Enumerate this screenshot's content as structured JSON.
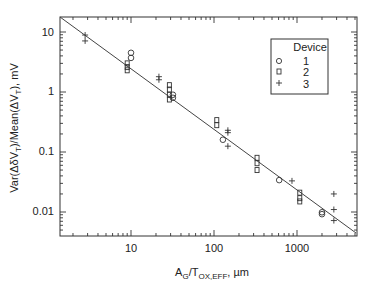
{
  "chart_data": {
    "type": "scatter",
    "title": "",
    "xlabel": "A_G/T_OX,EFF, µm",
    "ylabel": "Var(ΔδV_T)/Mean(ΔV_T), mV",
    "xscale": "log",
    "yscale": "log",
    "xlim": [
      1.4,
      5200
    ],
    "ylim": [
      0.0045,
      18
    ],
    "x_ticks": [
      10,
      100,
      1000
    ],
    "x_tick_labels": [
      "10",
      "100",
      "1000"
    ],
    "y_ticks": [
      0.01,
      0.1,
      1,
      10
    ],
    "y_tick_labels": [
      "0.01",
      "0.1",
      "1",
      "10"
    ],
    "grid": false,
    "legend": {
      "title": "Device",
      "position": "upper right",
      "entries": [
        {
          "marker": "circle",
          "label": "1"
        },
        {
          "marker": "square",
          "label": "2"
        },
        {
          "marker": "plus",
          "label": "3"
        }
      ]
    },
    "series": [
      {
        "name": "1",
        "marker": "circle",
        "points": [
          [
            10,
            4.5
          ],
          [
            10,
            3.7
          ],
          [
            32,
            0.9
          ],
          [
            32,
            0.8
          ],
          [
            128,
            0.16
          ],
          [
            610,
            0.034
          ],
          [
            2000,
            0.0099
          ],
          [
            2000,
            0.0092
          ]
        ]
      },
      {
        "name": "2",
        "marker": "square",
        "points": [
          [
            9,
            3.0
          ],
          [
            9,
            2.6
          ],
          [
            9,
            2.3
          ],
          [
            29,
            1.3
          ],
          [
            29,
            1.1
          ],
          [
            29,
            0.9
          ],
          [
            29,
            0.75
          ],
          [
            108,
            0.34
          ],
          [
            108,
            0.28
          ],
          [
            330,
            0.08
          ],
          [
            330,
            0.065
          ],
          [
            330,
            0.05
          ],
          [
            1080,
            0.021
          ],
          [
            1080,
            0.017
          ],
          [
            1080,
            0.015
          ]
        ]
      },
      {
        "name": "3",
        "marker": "plus",
        "points": [
          [
            2.8,
            8.9
          ],
          [
            2.8,
            7.1
          ],
          [
            21.7,
            1.8
          ],
          [
            21.7,
            1.6
          ],
          [
            147,
            0.23
          ],
          [
            147,
            0.21
          ],
          [
            147,
            0.125
          ],
          [
            870,
            0.033
          ],
          [
            2780,
            0.02
          ],
          [
            2780,
            0.011
          ],
          [
            2780,
            0.0072
          ]
        ]
      }
    ],
    "fit_line": {
      "type": "power-law",
      "from": [
        1.4,
        18
      ],
      "to": [
        5200,
        0.0045
      ]
    }
  },
  "labels": {
    "legend_title": "Device",
    "legend_1": "1",
    "legend_2": "2",
    "legend_3": "3",
    "xtick_10": "10",
    "xtick_100": "100",
    "xtick_1000": "1000",
    "ytick_10": "10",
    "ytick_1": "1",
    "ytick_01": "0.1",
    "ytick_001": "0.01"
  }
}
